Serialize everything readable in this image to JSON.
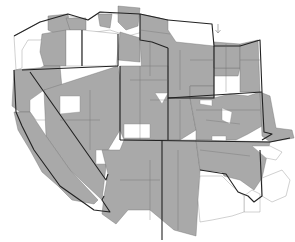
{
  "map": {
    "type": "choropleth",
    "region": "Western United States (counties)",
    "legend": null,
    "colors": {
      "shaded": "#a9a9a9",
      "unshaded": "#ffffff",
      "state_border": "#222222",
      "county_border": "#6a6a6a"
    },
    "north_arrow_label": "↑",
    "states_shown": [
      "Washington",
      "Oregon",
      "Idaho",
      "Montana",
      "Wyoming",
      "North Dakota",
      "South Dakota",
      "California",
      "Nevada",
      "Utah",
      "Colorado",
      "Nebraska",
      "Kansas",
      "Arizona",
      "New Mexico",
      "Oklahoma",
      "Texas"
    ]
  }
}
